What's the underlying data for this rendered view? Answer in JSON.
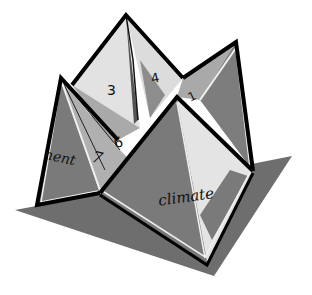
{
  "figure": {
    "labels": {
      "front_flap": "climate",
      "left_flap": "nent",
      "number_1": "1",
      "number_3": "3",
      "number_4": "4",
      "number_6": "6",
      "number_7": "7"
    },
    "colors": {
      "shadow": "#6e6e6e",
      "dark_face": "#7a7a7a",
      "mid_face": "#a6a6a6",
      "light_face": "#e3e3e3",
      "outline": "#000000",
      "highlight_edge": "#f2f2f2"
    }
  }
}
